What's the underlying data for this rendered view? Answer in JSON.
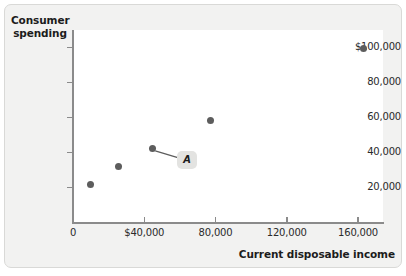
{
  "chart_data": {
    "type": "scatter",
    "title": "",
    "xlabel": "Current disposable income",
    "ylabel": "Consumer spending",
    "xlim": [
      0,
      174000
    ],
    "ylim": [
      0,
      110000
    ],
    "grid": false,
    "legend": false,
    "x_ticks": [
      {
        "value": 0,
        "label": "0"
      },
      {
        "value": 40000,
        "label": "$40,000"
      },
      {
        "value": 80000,
        "label": "80,000"
      },
      {
        "value": 120000,
        "label": "120,000"
      },
      {
        "value": 160000,
        "label": "160,000"
      }
    ],
    "y_ticks": [
      {
        "value": 20000,
        "label": "20,000"
      },
      {
        "value": 40000,
        "label": "40,000"
      },
      {
        "value": 60000,
        "label": "60,000"
      },
      {
        "value": 80000,
        "label": "80,000"
      },
      {
        "value": 100000,
        "label": "$100,000"
      }
    ],
    "points": [
      {
        "x": 9600,
        "y": 21800
      },
      {
        "x": 25400,
        "y": 32000
      },
      {
        "x": 44500,
        "y": 42200
      },
      {
        "x": 77000,
        "y": 58500
      },
      {
        "x": 163000,
        "y": 99500
      }
    ],
    "annotations": [
      {
        "label": "A",
        "points_to_x": 44500,
        "points_to_y": 42200,
        "label_x": 63000,
        "label_y": 36000
      }
    ],
    "colors": {
      "point": "#5d5d5d",
      "axis": "#8b8b8b",
      "plot_background": "#ffffff",
      "figure_background": "#f2f2f1",
      "text": "#1c1c1c",
      "annotation_background": "#e3e3e1"
    }
  }
}
